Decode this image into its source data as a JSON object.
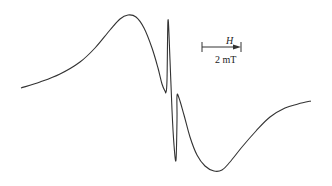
{
  "figure": {
    "type": "EPR derivative spectrum",
    "scale_bar": {
      "field_label": "H",
      "length_label": "2 mT"
    },
    "curve_points": [
      [
        21,
        88
      ],
      [
        40,
        82
      ],
      [
        60,
        74
      ],
      [
        80,
        62
      ],
      [
        95,
        48
      ],
      [
        110,
        30
      ],
      [
        120,
        19
      ],
      [
        128,
        15
      ],
      [
        136,
        17
      ],
      [
        144,
        28
      ],
      [
        152,
        48
      ],
      [
        158,
        68
      ],
      [
        162,
        84
      ],
      [
        165,
        91
      ],
      [
        166,
        92
      ],
      [
        167,
        80
      ],
      [
        168,
        20
      ],
      [
        170,
        60
      ],
      [
        172,
        110
      ],
      [
        174,
        145
      ],
      [
        176,
        160
      ],
      [
        177,
        120
      ],
      [
        177,
        96
      ],
      [
        179,
        98
      ],
      [
        184,
        115
      ],
      [
        190,
        137
      ],
      [
        197,
        155
      ],
      [
        205,
        166
      ],
      [
        214,
        171
      ],
      [
        222,
        170
      ],
      [
        230,
        162
      ],
      [
        242,
        147
      ],
      [
        256,
        131
      ],
      [
        270,
        117
      ],
      [
        285,
        108
      ],
      [
        298,
        104
      ],
      [
        311,
        101
      ]
    ],
    "colors": {
      "line": "#333333",
      "background": "#ffffff"
    }
  }
}
